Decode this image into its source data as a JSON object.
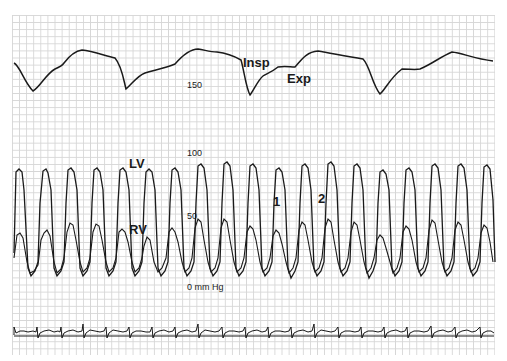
{
  "figure": {
    "respiration_labels": {
      "insp": "Insp",
      "exp": "Exp"
    },
    "pressure_labels": {
      "lv": "LV",
      "rv": "RV"
    },
    "beat_markers": {
      "first": "1",
      "second": "2"
    },
    "scale_labels": {
      "p150": "150",
      "p100": "100",
      "p50": "50",
      "zero": "0 mm Hg"
    },
    "colors": {
      "trace": "#1a1a1a",
      "grid": "#d6d6d6",
      "background": "#ffffff"
    }
  }
}
